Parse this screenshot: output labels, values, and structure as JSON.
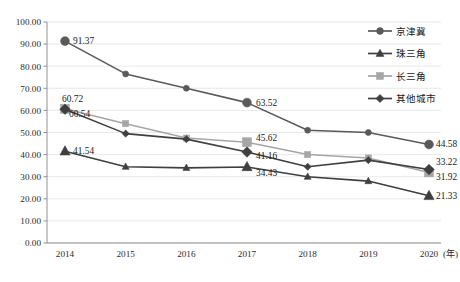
{
  "chart_data": {
    "type": "line",
    "title": "",
    "xlabel": "(年)",
    "ylabel": "",
    "x": [
      "2014",
      "2015",
      "2016",
      "2017",
      "2018",
      "2019",
      "2020"
    ],
    "categories": [
      "2014",
      "2015",
      "2016",
      "2017",
      "2018",
      "2019",
      "2020"
    ],
    "ylim": [
      0,
      100
    ],
    "ytick_labels": [
      "0.00",
      "10.00",
      "20.00",
      "30.00",
      "40.00",
      "50.00",
      "60.00",
      "70.00",
      "80.00",
      "90.00",
      "100.00"
    ],
    "ytick_values": [
      0,
      10,
      20,
      30,
      40,
      50,
      60,
      70,
      80,
      90,
      100
    ],
    "grid": true,
    "legend_position": "top-right",
    "series": [
      {
        "name": "京津冀",
        "marker": "circle",
        "color": "#5a5a5a",
        "values": [
          91.37,
          76.5,
          70.0,
          63.52,
          51.0,
          50.0,
          44.58
        ],
        "labels": [
          {
            "index": 0,
            "text": "91.37"
          },
          {
            "index": 3,
            "text": "63.52"
          },
          {
            "index": 6,
            "text": "44.58"
          }
        ]
      },
      {
        "name": "珠三角",
        "marker": "triangle",
        "color": "#3f3f3f",
        "values": [
          41.54,
          34.5,
          34.0,
          34.43,
          30.0,
          28.0,
          21.33
        ],
        "labels": [
          {
            "index": 0,
            "text": "41.54"
          },
          {
            "index": 3,
            "text": "34.43"
          },
          {
            "index": 6,
            "text": "21.33"
          }
        ]
      },
      {
        "name": "长三角",
        "marker": "square",
        "color": "#a6a6a6",
        "values": [
          60.72,
          54.0,
          47.5,
          45.62,
          40.0,
          38.5,
          31.92
        ],
        "labels": [
          {
            "index": 0,
            "text": "60.72"
          },
          {
            "index": 3,
            "text": "45.62"
          },
          {
            "index": 6,
            "text": "31.92"
          }
        ]
      },
      {
        "name": "其他城市",
        "marker": "diamond",
        "color": "#3f3f3f",
        "values": [
          60.54,
          49.5,
          47.0,
          41.16,
          34.5,
          37.5,
          33.22
        ],
        "labels": [
          {
            "index": 0,
            "text": "60.54"
          },
          {
            "index": 3,
            "text": "41.16"
          },
          {
            "index": 6,
            "text": "33.22"
          }
        ]
      }
    ],
    "legend": [
      {
        "label": "京津冀",
        "marker": "circle",
        "color": "#5a5a5a"
      },
      {
        "label": "珠三角",
        "marker": "triangle",
        "color": "#3f3f3f"
      },
      {
        "label": "长三角",
        "marker": "square",
        "color": "#a6a6a6"
      },
      {
        "label": "其他城市",
        "marker": "diamond",
        "color": "#3f3f3f"
      }
    ]
  }
}
